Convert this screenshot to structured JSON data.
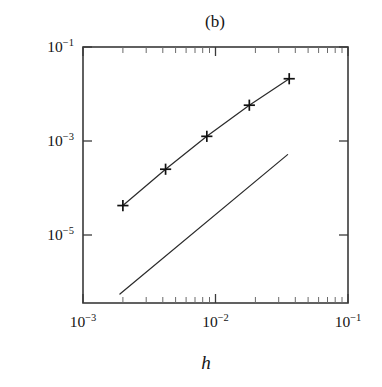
{
  "chart_data": {
    "type": "line",
    "title": "(b)",
    "xlabel": "h",
    "ylabel": "",
    "xscale": "log",
    "yscale": "log",
    "xlim": [
      0.001,
      0.1
    ],
    "ylim": [
      1e-06,
      0.1
    ],
    "grid": false,
    "legend": null,
    "x_ticks": [
      0.001,
      0.01,
      0.1
    ],
    "x_tick_labels": [
      "10−3",
      "10−2",
      "10−1"
    ],
    "y_ticks": [
      0.1,
      0.001,
      1e-05
    ],
    "y_tick_labels": [
      "10−1",
      "10−3",
      "10−5"
    ],
    "series": [
      {
        "name": "error",
        "marker": "plus",
        "x": [
          0.002,
          0.0042,
          0.0086,
          0.018,
          0.036
        ],
        "values": [
          8e-05,
          0.00041,
          0.0018,
          0.0073,
          0.024
        ]
      },
      {
        "name": "reference slope 2",
        "marker": "none",
        "x": [
          0.0019,
          0.035
        ],
        "values": [
          1.5e-06,
          0.00079
        ]
      }
    ],
    "annotations": []
  },
  "axis": {
    "x_tick_mantissa": "10",
    "y_tick_mantissa": "10",
    "x_tick_exponents": [
      "−3",
      "−2",
      "−1"
    ],
    "y_tick_exponents": [
      "−1",
      "−3",
      "−5"
    ]
  },
  "labels": {
    "panel_title": "(b)",
    "x_axis_title": "h"
  },
  "colors": {
    "background": "#ffffff",
    "frame": "#3a3a3a",
    "line": "#2b2b2b",
    "marker": "#111111",
    "text": "#141414"
  }
}
